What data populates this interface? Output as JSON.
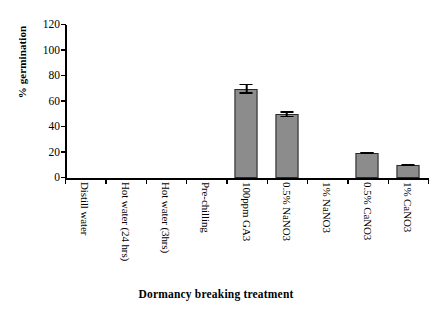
{
  "chart_data": {
    "type": "bar",
    "title": "",
    "xlabel": "Dormancy breaking treatment",
    "ylabel": "% germination",
    "categories": [
      "Distill water",
      "Hot water (24 hrs)",
      "Hot water (3hrs)",
      "Pre-chilling",
      "100ppm GA3",
      "0.5% NaNO3",
      "1% NaNO3",
      "0.5% CaNO3",
      "1% CaNO3"
    ],
    "values": [
      0,
      0,
      0,
      0,
      70,
      50,
      0,
      20,
      10
    ],
    "errors": [
      0,
      0,
      0,
      0,
      4,
      2.5,
      0,
      0.8,
      0.5
    ],
    "ylim": [
      0,
      120
    ],
    "yticks": [
      0,
      20,
      40,
      60,
      80,
      100,
      120
    ],
    "ytick_labels": [
      "0",
      "20",
      "40",
      "60",
      "80",
      "100",
      "120"
    ],
    "grid": false,
    "legend": "none",
    "bar_color": "#8c8c8c",
    "bar_border_color": "#2a2a2a",
    "axis_color": "#000000"
  }
}
